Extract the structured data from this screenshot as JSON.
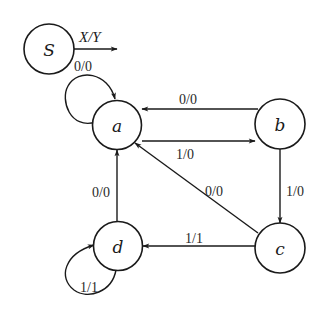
{
  "diagram": {
    "type": "state-transition-diagram",
    "legend": {
      "label": "X/Y",
      "meaning_hidden": true
    },
    "states": [
      {
        "id": "S",
        "label": "S",
        "role": "legend"
      },
      {
        "id": "a",
        "label": "a"
      },
      {
        "id": "b",
        "label": "b"
      },
      {
        "id": "c",
        "label": "c"
      },
      {
        "id": "d",
        "label": "d"
      }
    ],
    "transitions": [
      {
        "from": "a",
        "to": "a",
        "label": "0/0"
      },
      {
        "from": "b",
        "to": "a",
        "label": "0/0"
      },
      {
        "from": "a",
        "to": "b",
        "label": "1/0"
      },
      {
        "from": "b",
        "to": "c",
        "label": "1/0"
      },
      {
        "from": "c",
        "to": "a",
        "label": "0/0"
      },
      {
        "from": "c",
        "to": "d",
        "label": "1/1"
      },
      {
        "from": "d",
        "to": "a",
        "label": "0/0"
      },
      {
        "from": "d",
        "to": "d",
        "label": "1/1"
      }
    ],
    "colors": {
      "stroke": "#1a1a1a",
      "background": "#ffffff"
    }
  }
}
